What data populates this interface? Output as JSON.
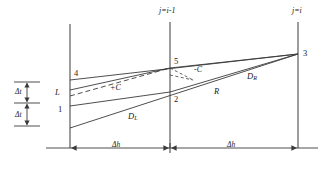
{
  "figure": {
    "type": "characteristics-grid-diagram",
    "background_color": "#ffffff",
    "line_color": "#3a3a3a",
    "text_color": "#1a1a1a"
  },
  "axes": {
    "vertical_lines": [
      {
        "id": "left",
        "label": "",
        "x": 70
      },
      {
        "id": "middle",
        "label": "j=i-1",
        "label_parts": {
          "var": "j",
          "eq": "=",
          "val": "i-1"
        },
        "x": 170
      },
      {
        "id": "right",
        "label": "j=i",
        "label_parts": {
          "var": "j",
          "eq": "=",
          "val": "i"
        },
        "x": 298
      }
    ]
  },
  "nodes": [
    {
      "name": "4",
      "label": "4",
      "x": 74,
      "y": 74
    },
    {
      "name": "L",
      "label": "L",
      "x": 56,
      "y": 93
    },
    {
      "name": "1",
      "label": "1",
      "x": 58,
      "y": 110
    },
    {
      "name": "5",
      "label": "5",
      "x": 174,
      "y": 62
    },
    {
      "name": "2",
      "label": "2",
      "x": 174,
      "y": 100
    },
    {
      "name": "R",
      "label": "R",
      "x": 216,
      "y": 92
    },
    {
      "name": "3",
      "label": "3",
      "x": 303,
      "y": 54
    }
  ],
  "curve_labels": [
    {
      "name": "d-left",
      "base": "D",
      "subscript": "L",
      "x": 130,
      "y": 117
    },
    {
      "name": "d-right",
      "base": "D",
      "subscript": "R",
      "x": 249,
      "y": 77
    }
  ],
  "characteristic_labels": [
    {
      "name": "plus-c",
      "label": "+C",
      "x": 112,
      "y": 88
    },
    {
      "name": "minus-c",
      "label": "-C",
      "x": 196,
      "y": 70
    }
  ],
  "spacing": {
    "time_steps": [
      {
        "name": "delta-t-upper",
        "label": "Δt",
        "x": 21,
        "y": 89
      },
      {
        "name": "delta-t-lower",
        "label": "Δt",
        "x": 21,
        "y": 113
      }
    ],
    "space_steps": [
      {
        "name": "delta-h-left",
        "label": "Δh",
        "x": 112,
        "y": 141
      },
      {
        "name": "delta-h-right",
        "label": "Δh",
        "x": 227,
        "y": 141
      }
    ]
  }
}
